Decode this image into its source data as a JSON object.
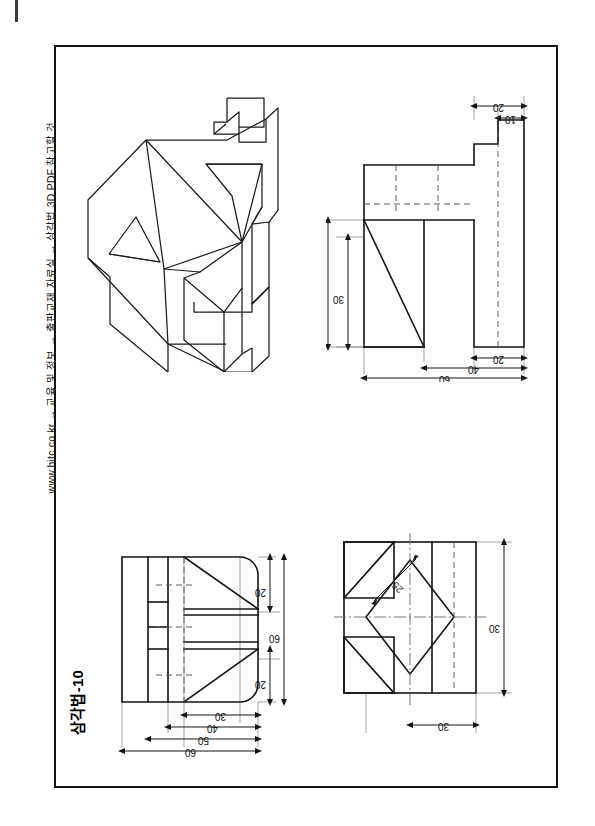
{
  "page": {
    "side_note": "www.hitc.co.kr → 교육 및 정보 → 출판교재 자료실 → 삼각법 3D PDF 참고할 것",
    "sheet_title": "삼각법-10",
    "frame": {
      "x": 54,
      "y": 45,
      "width": 504,
      "height": 743
    }
  },
  "views": {
    "isometric": {
      "name": "isometric-pictorial-view",
      "position": "top-left"
    },
    "front": {
      "name": "front-view",
      "position": "top-right",
      "dimensions": [
        {
          "value": "20",
          "orientation": "horizontal",
          "location": "top-right-outer"
        },
        {
          "value": "10",
          "orientation": "horizontal",
          "location": "top-right-inner"
        },
        {
          "value": "40",
          "orientation": "vertical",
          "location": "left-outer"
        },
        {
          "value": "30",
          "orientation": "vertical",
          "location": "left-inner"
        },
        {
          "value": "20",
          "orientation": "horizontal",
          "location": "bottom-right"
        },
        {
          "value": "40",
          "orientation": "horizontal",
          "location": "bottom-middle"
        },
        {
          "value": "60",
          "orientation": "horizontal",
          "location": "bottom-outer"
        }
      ]
    },
    "top": {
      "name": "top-view",
      "position": "bottom-left",
      "dimensions": [
        {
          "value": "20",
          "orientation": "vertical",
          "location": "right-upper"
        },
        {
          "value": "60",
          "orientation": "vertical",
          "location": "right-outer"
        },
        {
          "value": "20",
          "orientation": "vertical",
          "location": "right-lower"
        },
        {
          "value": "30",
          "orientation": "horizontal",
          "location": "bottom-inner"
        },
        {
          "value": "40",
          "orientation": "horizontal",
          "location": "bottom-middle"
        },
        {
          "value": "50",
          "orientation": "horizontal",
          "location": "bottom-outer-2"
        },
        {
          "value": "60",
          "orientation": "horizontal",
          "location": "bottom-outer"
        }
      ]
    },
    "side": {
      "name": "side-view",
      "position": "bottom-right",
      "dimensions": [
        {
          "value": "25",
          "orientation": "diagonal",
          "location": "upper-left-diagonal"
        },
        {
          "value": "30",
          "orientation": "vertical",
          "location": "right"
        },
        {
          "value": "30",
          "orientation": "horizontal",
          "location": "bottom"
        }
      ]
    }
  },
  "colors": {
    "line": "#141414",
    "hidden": "#5a5a5a",
    "center": "#6a6a6a",
    "extension": "#8a8a8a",
    "background": "#ffffff"
  }
}
